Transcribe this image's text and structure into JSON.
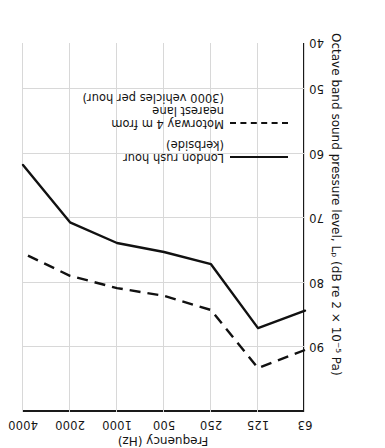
{
  "chart_data": {
    "type": "line",
    "title": "",
    "xlabel": "Frequency (Hz)",
    "ylabel": "Octave band sound pressure level, Lₚ (dB re 2 × 10⁻⁵ Pa)",
    "x_tick_labels": [
      "63",
      "125",
      "250",
      "500",
      "1000",
      "2000",
      "4000"
    ],
    "x_values": [
      63,
      125,
      250,
      500,
      1000,
      2000,
      4000
    ],
    "x_scale": "log-octave",
    "y_tick_labels": [
      "40",
      "50",
      "60",
      "70",
      "80",
      "90"
    ],
    "ylim": [
      40,
      93
    ],
    "y_ticks": [
      40,
      50,
      60,
      70,
      80,
      90
    ],
    "grid": true,
    "legend_position": "upper-left-inside",
    "series": [
      {
        "name": "London rush hour (kerbside)",
        "style": "solid",
        "color": "#111111",
        "categories": [
          63,
          125,
          250,
          500,
          1000,
          2000,
          4000
        ],
        "values": [
          81.5,
          84.2,
          74.3,
          72.4,
          71.0,
          67.8,
          58.9
        ]
      },
      {
        "name": "Motorway 4 m from nearest lane (3000 vehicles per hour)",
        "style": "dashed",
        "color": "#111111",
        "categories": [
          63,
          125,
          250,
          500,
          1000,
          2000,
          4000
        ],
        "values": [
          87.6,
          90.4,
          81.4,
          79.2,
          78.0,
          76.1,
          72.6
        ]
      }
    ]
  },
  "axes": {
    "x_title": "Frequency (Hz)",
    "y_title": "Octave band sound pressure level, Lₚ (dB re 2 × 10⁻⁵ Pa)",
    "x_ticks": [
      "63",
      "125",
      "250",
      "500",
      "1000",
      "2000",
      "4000"
    ],
    "y_ticks": [
      "40",
      "50",
      "60",
      "70",
      "80",
      "90"
    ]
  },
  "legend": {
    "items": [
      {
        "key": "solid-line-key",
        "label": "London rush hour\n(kerbside)"
      },
      {
        "key": "dashed-line-key",
        "label": "Motorway 4 m from\nnearest lane\n(3000 vehicles per hour)"
      }
    ]
  }
}
